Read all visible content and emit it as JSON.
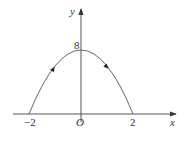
{
  "diagram": {
    "type": "parabola-on-axes",
    "axes": {
      "x_label": "x",
      "y_label": "y",
      "origin_label": "O"
    },
    "ticks": {
      "x_left": "−2",
      "x_right": "2",
      "y_top": "8"
    },
    "curve": {
      "description": "downward parabola y = 8 − 2x² from (−2,0) through (0,8) to (2,0)",
      "direction": "arrows indicate travel left-to-right: upward on left branch, downward on right branch"
    },
    "colors": {
      "line": "#444444",
      "background": "#ffffff"
    }
  }
}
